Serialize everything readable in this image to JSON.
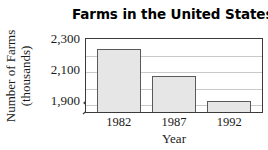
{
  "chart_data": {
    "type": "bar",
    "title": "Farms in the United States",
    "xlabel": "Year",
    "ylabel": "Number of Farms (thousands)",
    "ylabel_line1": "Number of Farms",
    "ylabel_line2": "(thousands)",
    "categories": [
      "1982",
      "1987",
      "1992"
    ],
    "values": [
      2240,
      2080,
      1925
    ],
    "ylim": [
      1860,
      2300
    ],
    "yticks": [
      2300,
      2100,
      1900
    ],
    "ytick_labels": [
      "2,300",
      "2,100",
      "1,900"
    ],
    "gridlines": [
      2300,
      2200,
      2100,
      2000,
      1900
    ],
    "grid": true,
    "legend": "none",
    "axis_break": true,
    "bar_fill_color": "#e6e6e6",
    "bar_border_color": "#5a5a5a",
    "grid_color": "#c9c9c9",
    "axis_color": "#3a3a3a"
  }
}
